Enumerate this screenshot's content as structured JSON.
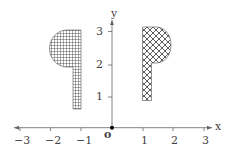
{
  "diagram": {
    "type": "coordinate-plane-reflection",
    "axes": {
      "x_label": "x",
      "y_label": "y",
      "origin_label": "o",
      "x_ticks": [
        "−3",
        "−2",
        "−1",
        "1",
        "2",
        "3"
      ],
      "y_ticks": [
        "1",
        "2",
        "3"
      ],
      "xlim": [
        -3,
        3
      ],
      "ylim": [
        0,
        3
      ]
    },
    "shapes": [
      {
        "name": "left-shape",
        "fill_pattern": "square-grid",
        "description": "Flag-like shape: stem along x≈-1.1 to -1.3 from y≈0.6 to 3.1, with semicircle on left side near top"
      },
      {
        "name": "right-shape",
        "fill_pattern": "diagonal-crosshatch",
        "description": "Flag-like shape: stem along x≈1 to 1.3 from y≈0.9 to 3.2, with semicircle on right side near top"
      }
    ],
    "colors": {
      "axis": "#555555",
      "pattern": "#333333",
      "origin_dot": "#000000"
    }
  }
}
